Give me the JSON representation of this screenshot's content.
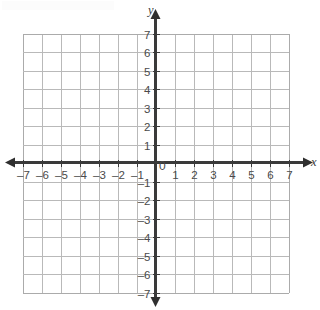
{
  "chart_data": {
    "type": "scatter",
    "title": "",
    "subtitle": "",
    "xlabel": "x",
    "ylabel": "y",
    "xlim": [
      -7,
      7
    ],
    "ylim": [
      -7,
      7
    ],
    "grid": true,
    "grid_step": 1,
    "legend": "none",
    "series": [],
    "x_tick_labels": [
      "–7",
      "–6",
      "–5",
      "–4",
      "–3",
      "–2",
      "–1",
      "",
      "1",
      "2",
      "3",
      "4",
      "5",
      "6",
      "7"
    ],
    "y_tick_labels": [
      "–7",
      "–6",
      "–5",
      "–4",
      "–3",
      "–2",
      "–1",
      "",
      "1",
      "2",
      "3",
      "4",
      "5",
      "6",
      "7"
    ],
    "x_tick_values": [
      -7,
      -6,
      -5,
      -4,
      -3,
      -2,
      -1,
      0,
      1,
      2,
      3,
      4,
      5,
      6,
      7
    ],
    "y_tick_values": [
      -7,
      -6,
      -5,
      -4,
      -3,
      -2,
      -1,
      0,
      1,
      2,
      3,
      4,
      5,
      6,
      7
    ],
    "origin_label": "0",
    "axis_arrows": [
      "left",
      "right",
      "up",
      "down"
    ],
    "colors": {
      "gridline": "#b9b9b9",
      "axis": "#3a3a3a",
      "label": "#4a4a4a",
      "background": "#ffffff"
    }
  },
  "axes": {
    "x_label": "x",
    "y_label": "y"
  }
}
